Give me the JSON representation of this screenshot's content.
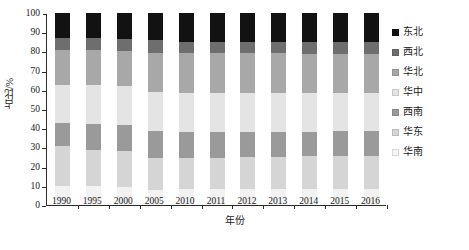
{
  "chart_data": {
    "type": "bar",
    "stacked": true,
    "stack_total": 100,
    "title": "",
    "xlabel": "年份",
    "ylabel": "占比/%",
    "ylim": [
      0,
      100
    ],
    "yticks": [
      0,
      10,
      20,
      30,
      40,
      50,
      60,
      70,
      80,
      90,
      100
    ],
    "grid": false,
    "legend_position": "right",
    "categories": [
      "1990",
      "1995",
      "2000",
      "2005",
      "2010",
      "2011",
      "2012",
      "2013",
      "2014",
      "2015",
      "2016"
    ],
    "series": [
      {
        "name": "华南",
        "color": "#f2f2f2",
        "values": [
          10.0,
          9.7,
          9.3,
          8.0,
          8.1,
          8.2,
          8.3,
          8.4,
          8.4,
          8.5,
          8.6
        ]
      },
      {
        "name": "华东",
        "color": "#d5d5d5",
        "values": [
          20.5,
          19.1,
          18.8,
          16.6,
          16.4,
          16.3,
          16.6,
          16.8,
          16.9,
          17.0,
          17.1
        ]
      },
      {
        "name": "西南",
        "color": "#9a9a9a",
        "values": [
          12.0,
          13.6,
          13.7,
          13.8,
          13.4,
          13.3,
          13.2,
          13.0,
          12.9,
          12.8,
          12.7
        ]
      },
      {
        "name": "华中",
        "color": "#e4e4e4",
        "values": [
          20.0,
          20.1,
          20.2,
          20.3,
          20.4,
          20.3,
          20.2,
          20.1,
          20.1,
          20.0,
          20.0
        ]
      },
      {
        "name": "华北",
        "color": "#a8a8a8",
        "values": [
          18.0,
          18.0,
          18.2,
          20.6,
          20.9,
          21.0,
          20.8,
          20.7,
          20.6,
          20.6,
          20.5
        ]
      },
      {
        "name": "西北",
        "color": "#6e6e6e",
        "values": [
          6.5,
          6.6,
          6.5,
          6.6,
          5.8,
          5.9,
          6.0,
          6.1,
          6.2,
          6.2,
          6.2
        ]
      },
      {
        "name": "东北",
        "color": "#121212",
        "values": [
          13.0,
          12.9,
          13.3,
          14.1,
          15.0,
          15.0,
          14.9,
          14.9,
          14.9,
          14.9,
          14.9
        ]
      }
    ]
  },
  "legend": {
    "items": [
      {
        "label": "东北",
        "color": "#121212"
      },
      {
        "label": "西北",
        "color": "#6e6e6e"
      },
      {
        "label": "华北",
        "color": "#a8a8a8"
      },
      {
        "label": "华中",
        "color": "#e4e4e4"
      },
      {
        "label": "西南",
        "color": "#9a9a9a"
      },
      {
        "label": "华东",
        "color": "#d5d5d5"
      },
      {
        "label": "华南",
        "color": "#f6f6f6"
      }
    ]
  }
}
